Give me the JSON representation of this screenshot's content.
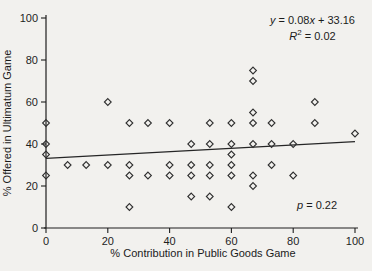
{
  "page": {
    "background": "#f2f1ee",
    "ink": "#1e1e1e"
  },
  "chart_data": {
    "type": "scatter",
    "title": "",
    "xlabel": "% Contribution in Public Goods Game",
    "ylabel": "% Offered in Ultimatum Game",
    "xlim": [
      0,
      100
    ],
    "ylim": [
      0,
      100
    ],
    "x_ticks": [
      "0",
      "20",
      "40",
      "60",
      "80",
      "100"
    ],
    "y_ticks": [
      "0",
      "20",
      "40",
      "60",
      "80",
      "100"
    ],
    "x_tick_values": [
      0,
      20,
      40,
      60,
      80,
      100
    ],
    "y_tick_values": [
      0,
      20,
      40,
      60,
      80,
      100
    ],
    "grid": "off",
    "marker": "open-diamond",
    "marker_color": "#2f2f2f",
    "points": [
      [
        0,
        25
      ],
      [
        0,
        35
      ],
      [
        0,
        40
      ],
      [
        0,
        50
      ],
      [
        7,
        30
      ],
      [
        13,
        30
      ],
      [
        20,
        30
      ],
      [
        20,
        60
      ],
      [
        27,
        10
      ],
      [
        27,
        25
      ],
      [
        27,
        30
      ],
      [
        27,
        50
      ],
      [
        33,
        25
      ],
      [
        33,
        50
      ],
      [
        40,
        25
      ],
      [
        40,
        30
      ],
      [
        40,
        50
      ],
      [
        47,
        15
      ],
      [
        47,
        25
      ],
      [
        47,
        30
      ],
      [
        47,
        40
      ],
      [
        53,
        15
      ],
      [
        53,
        25
      ],
      [
        53,
        30
      ],
      [
        53,
        40
      ],
      [
        53,
        50
      ],
      [
        60,
        10
      ],
      [
        60,
        25
      ],
      [
        60,
        30
      ],
      [
        60,
        35
      ],
      [
        60,
        40
      ],
      [
        60,
        50
      ],
      [
        67,
        20
      ],
      [
        67,
        25
      ],
      [
        67,
        40
      ],
      [
        67,
        50
      ],
      [
        67,
        55
      ],
      [
        67,
        70
      ],
      [
        67,
        75
      ],
      [
        73,
        30
      ],
      [
        73,
        40
      ],
      [
        73,
        50
      ],
      [
        80,
        25
      ],
      [
        80,
        40
      ],
      [
        87,
        50
      ],
      [
        87,
        60
      ],
      [
        100,
        45
      ]
    ],
    "trendline": {
      "slope": 0.08,
      "intercept": 33.16,
      "x_start": 0,
      "x_end": 100
    },
    "annotations": {
      "equation": {
        "v1": "y",
        "t1": " = 0.08",
        "v2": "x",
        "t2": " + 33.16"
      },
      "r2": {
        "v": "R",
        "exp": "2",
        "t": " = 0.02"
      },
      "p": {
        "v": "p",
        "t": " = 0.22"
      },
      "equation_text": "y = 0.08x + 33.16",
      "r2_text": "R2 = 0.02",
      "p_text": "p = 0.22"
    }
  }
}
